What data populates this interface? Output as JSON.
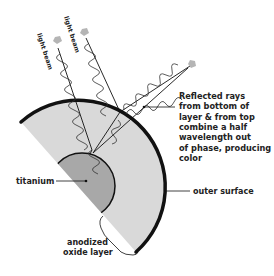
{
  "diagram": {
    "beam_labels": [
      "light beam",
      "light beam"
    ],
    "reflected_label": [
      "Reflected rays",
      "from bottom of",
      "layer & from top",
      "combine a half",
      "wavelength out",
      "of phase, producing",
      "color"
    ],
    "outer_surface_label": "outer surface",
    "titanium_label": "titanium",
    "oxide_label": [
      "anodized",
      "oxide layer"
    ],
    "colors": {
      "oxide_layer": "#d9d9d9",
      "titanium": "#a8a8a8",
      "outline": "#111111",
      "arrow": "#b5b5b5"
    }
  }
}
